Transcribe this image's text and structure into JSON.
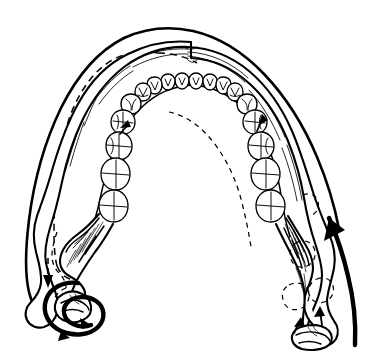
{
  "figure": {
    "title": "Mandible lateral excursion diagram",
    "caption": "",
    "background_color": "#ffffff",
    "ink_color": "#000000",
    "line_style": "black-and-white-ink-line-art",
    "view": "superior (occlusal) view of lower jaw"
  },
  "anatomy": {
    "dental_arch": {
      "label": "mandibular dental arch",
      "tooth_count_total": 26,
      "left_quadrant_count": 13,
      "right_quadrant_count": 13,
      "tooth_types_anterior_to_posterior": [
        "incisor",
        "incisor",
        "canine",
        "premolar",
        "premolar",
        "molar",
        "molar"
      ]
    },
    "parts": [
      {
        "name": "alveolar-ridge",
        "label": "alveolar ridge"
      },
      {
        "name": "mandibular-body-left",
        "label": "left body of mandible"
      },
      {
        "name": "mandibular-body-right",
        "label": "right body of mandible"
      },
      {
        "name": "ramus-left",
        "label": "left ramus"
      },
      {
        "name": "ramus-right",
        "label": "right ramus"
      },
      {
        "name": "condyle-left",
        "label": "left condyle (rotating)"
      },
      {
        "name": "condyle-right",
        "label": "right condyle (translating)"
      },
      {
        "name": "coronoid-process-left",
        "label": "left coronoid process"
      },
      {
        "name": "coronoid-process-right",
        "label": "right coronoid process"
      }
    ]
  },
  "overlays": {
    "solid_silhouette": {
      "name": "displaced-position-silhouette",
      "label": "displaced jaw position (solid outline)",
      "style": "solid"
    },
    "dashed_silhouette": {
      "name": "rest-position-silhouette",
      "label": "original rest position (dashed outline)",
      "style": "dashed"
    },
    "dashed_condyle_ghosts": {
      "name": "condyle-original-position-ghost",
      "label": "original condyle position",
      "style": "dashed"
    }
  },
  "motion_markers": [
    {
      "name": "rotation-arrow-left-condyle",
      "label": "rotation about left condyle",
      "kind": "circular-arrow",
      "weight": "heavy",
      "direction": "counter-clockwise"
    },
    {
      "name": "translation-arrow-right-side",
      "label": "forward translation of right side",
      "kind": "long-curved-arrow",
      "weight": "heavy",
      "direction": "upward-forward"
    },
    {
      "name": "arrow-ridge-left",
      "label": "left ridge movement indicator",
      "kind": "small-arrowhead",
      "weight": "light",
      "direction": "upward"
    },
    {
      "name": "arrow-ridge-right",
      "label": "right ridge movement indicator",
      "kind": "small-arrowhead",
      "weight": "light",
      "direction": "upward"
    },
    {
      "name": "arrow-dashed-left-descent",
      "label": "downward displacement at left",
      "kind": "dashed-arrow",
      "weight": "light",
      "direction": "downward"
    },
    {
      "name": "arrow-condyle-right-inner",
      "label": "medial pull at right condyle",
      "kind": "small-arrow",
      "weight": "light",
      "direction": "up-left"
    },
    {
      "name": "arrow-condyle-right-outer",
      "label": "lateral pull at right condyle",
      "kind": "small-arrow",
      "weight": "light",
      "direction": "up-right"
    }
  ]
}
